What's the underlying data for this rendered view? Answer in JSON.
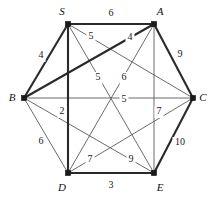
{
  "figure": {
    "kind": "weighted-undirected-graph",
    "background_color": "#ffffff",
    "thin_edge_color": "#5a5a5a",
    "bold_edge_color": "#2a2a2a",
    "vertex_color": "#1a1a1a"
  },
  "vertices": [
    {
      "id": "S",
      "label": "S",
      "x": 68,
      "y": 24,
      "label_x": 62,
      "label_y": 12
    },
    {
      "id": "A",
      "label": "A",
      "x": 154,
      "y": 24,
      "label_x": 160,
      "label_y": 12
    },
    {
      "id": "B",
      "label": "B",
      "x": 24,
      "y": 98,
      "label_x": 12,
      "label_y": 98
    },
    {
      "id": "C",
      "label": "C",
      "x": 193,
      "y": 98,
      "label_x": 203,
      "label_y": 98
    },
    {
      "id": "D",
      "label": "D",
      "x": 68,
      "y": 173,
      "label_x": 62,
      "label_y": 188
    },
    {
      "id": "E",
      "label": "E",
      "x": 154,
      "y": 173,
      "label_x": 160,
      "label_y": 188
    }
  ],
  "edges": [
    {
      "from": "S",
      "to": "A",
      "weight": "6",
      "bold": true,
      "label_x": 111,
      "label_y": 14
    },
    {
      "from": "S",
      "to": "B",
      "weight": "4",
      "bold": true,
      "label_x": 41,
      "label_y": 56
    },
    {
      "from": "S",
      "to": "C",
      "weight": "5",
      "bold": false,
      "label_x": 91,
      "label_y": 37
    },
    {
      "from": "S",
      "to": "D",
      "weight": "2",
      "bold": true,
      "label_x": 62,
      "label_y": 112
    },
    {
      "from": "S",
      "to": "E",
      "weight": "5",
      "bold": false,
      "label_x": 98,
      "label_y": 78
    },
    {
      "from": "A",
      "to": "B",
      "weight": "4",
      "bold": true,
      "label_x": 130,
      "label_y": 38
    },
    {
      "from": "A",
      "to": "C",
      "weight": "9",
      "bold": true,
      "label_x": 180,
      "label_y": 55
    },
    {
      "from": "A",
      "to": "D",
      "weight": "6",
      "bold": false,
      "label_x": 124,
      "label_y": 78
    },
    {
      "from": "A",
      "to": "E",
      "weight": "7",
      "bold": false,
      "label_x": 159,
      "label_y": 112
    },
    {
      "from": "B",
      "to": "C",
      "weight": "5",
      "bold": false,
      "label_x": 124,
      "label_y": 100
    },
    {
      "from": "B",
      "to": "D",
      "weight": "6",
      "bold": false,
      "label_x": 41,
      "label_y": 142
    },
    {
      "from": "B",
      "to": "E",
      "weight": "9",
      "bold": false,
      "label_x": 131,
      "label_y": 160
    },
    {
      "from": "C",
      "to": "D",
      "weight": "7",
      "bold": false,
      "label_x": 90,
      "label_y": 160
    },
    {
      "from": "C",
      "to": "E",
      "weight": "10",
      "bold": true,
      "label_x": 180,
      "label_y": 143
    },
    {
      "from": "D",
      "to": "E",
      "weight": "3",
      "bold": true,
      "label_x": 111,
      "label_y": 186
    }
  ],
  "chart_data": {
    "type": "graph",
    "title": "",
    "node_count": 6,
    "edge_count": 15,
    "nodes": [
      "S",
      "A",
      "B",
      "C",
      "D",
      "E"
    ],
    "weights": {
      "S-A": 6,
      "S-B": 4,
      "S-C": 5,
      "S-D": 2,
      "S-E": 5,
      "A-B": 4,
      "A-C": 9,
      "A-D": 6,
      "A-E": 7,
      "B-C": 5,
      "B-D": 6,
      "B-E": 9,
      "C-D": 7,
      "C-E": 10,
      "D-E": 3
    },
    "emphasized_edges": [
      "S-A",
      "S-B",
      "S-D",
      "A-B",
      "A-C",
      "C-E",
      "D-E"
    ]
  }
}
